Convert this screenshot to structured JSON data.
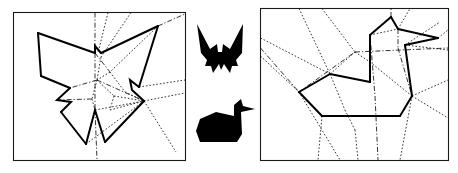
{
  "figure": {
    "width": 458,
    "height": 173,
    "background": "#ffffff",
    "ink_color": "#000000",
    "frame_color": "#1a1a1a",
    "panels": [
      {
        "id": "left-panel",
        "name": "butterfly-crease-pattern",
        "label": "",
        "frame": {
          "x": 13.5,
          "y": 12.5,
          "width": 172,
          "height": 148
        },
        "outline_path": "M 38 33 L 95 53 L 95 46 L 101 53 L 158 26 L 139 87 L 130 80 L 132 90 L 144 101 L 105 142 L 95 110 L 86 144 L 61 112 L 71 102 L 57 100 L 70 88 L 41 76 Z",
        "mountain_paths": [
          "M 38 33 L 95 53",
          "M 95 53 L 95 46 L 101 53",
          "M 101 53 L 158 26",
          "M 158 26 L 139 87",
          "M 139 87 L 130 80 L 132 90 L 144 101",
          "M 144 101 L 105 142",
          "M 105 142 L 95 110 L 86 144",
          "M 86 144 L 61 112",
          "M 61 112 L 71 102 L 57 100 L 70 88",
          "M 70 88 L 41 76",
          "M 41 76 L 38 33"
        ],
        "dotted_creases": [
          "M 108 12.5 L 98 53",
          "M 131 12.5 L 101 57",
          "M 101 57 L 97 80",
          "M 97 80 L 92 99",
          "M 92 99 L 95 110",
          "M 158 26 L 110 72",
          "M 110 72 L 97 80",
          "M 110 72 L 125 92",
          "M 125 92 L 144 101",
          "M 97 80 L 114 96",
          "M 114 96 L 144 101",
          "M 114 96 L 110 110",
          "M 110 110 L 144 101",
          "M 144 101 L 185 93",
          "M 139 87 L 185 80",
          "M 144 101 L 176 152",
          "M 95 110 L 144 101",
          "M 86 144 L 144 101",
          "M 105 142 L 144 101"
        ],
        "dashdot_creases": [
          "M 95 12.5 L 95 53",
          "M 95 53 L 95 110",
          "M 95 110 L 97 160",
          "M 158 26 L 185 14",
          "M 95 53 L 110 72",
          "M 97 80 L 70 88",
          "M 92 99 L 57 100",
          "M 97 80 L 144 101"
        ]
      },
      {
        "id": "right-panel",
        "name": "duck-crease-pattern",
        "label": "",
        "frame": {
          "x": 260.5,
          "y": 8.5,
          "width": 188,
          "height": 152
        },
        "outline_path": "M 391 17 L 370 35 L 370 82 L 330 74 L 299 92 L 322 116 L 400 116 L 412 96 L 405 45 L 438 38 L 398 29 Z",
        "mountain_paths": [
          "M 391 17 L 370 35",
          "M 370 35 L 370 82",
          "M 370 82 L 330 74",
          "M 330 74 L 299 92",
          "M 299 92 L 322 116",
          "M 322 116 L 400 116",
          "M 400 116 L 412 96",
          "M 412 96 L 405 45",
          "M 405 45 L 438 38",
          "M 438 38 L 398 29",
          "M 398 29 L 391 17"
        ],
        "dotted_creases": [
          "M 299 8.5 L 330 74",
          "M 322 8.5 L 355 52",
          "M 355 52 L 370 62",
          "M 355 52 L 330 74",
          "M 260.5 38 L 330 74",
          "M 260.5 56 L 299 92",
          "M 330 74 L 345 110",
          "M 345 110 L 355 130",
          "M 355 130 L 358 160",
          "M 299 92 L 322 116",
          "M 322 116 L 318 160",
          "M 299 92 L 340 160",
          "M 412 96 L 448 80",
          "M 412 96 L 448 118",
          "M 412 96 L 400 160",
          "M 405 45 L 440 22",
          "M 405 45 L 448 50",
          "M 398 29 L 410 8.5",
          "M 438 38 L 448 30",
          "M 370 35 L 398 29",
          "M 370 62 L 412 96"
        ],
        "dashdot_creases": [
          "M 391 17 L 391 8.5",
          "M 260.5 48 L 299 92",
          "M 299 92 L 355 52",
          "M 355 52 L 448 48",
          "M 370 35 L 375 96",
          "M 375 96 L 378 160",
          "M 398 29 L 398 48",
          "M 398 48 L 412 96",
          "M 330 74 L 370 82"
        ]
      }
    ],
    "silhouettes": [
      {
        "id": "butterfly-silhouette",
        "name": "butterfly-model-silhouette",
        "label": "",
        "fill": "#000000",
        "path": "M 197 24 L 210 49 L 217 44 L 218 52 L 222 52 L 223 44 L 230 49 L 243 24 L 242 53 L 236 60 L 238 66 L 232 66 L 230 73 L 224 64 L 221 70 L 219 64 L 213 73 L 211 66 L 205 66 L 207 60 L 201 53 Z"
      },
      {
        "id": "duck-silhouette",
        "name": "duck-model-silhouette",
        "label": "",
        "fill": "#000000",
        "path": "M 241 99 L 234 105 L 234 116 L 216 112 L 200 119 L 196 131 L 200 142 L 237 142 L 242 134 L 241 112 L 255 109 L 243 106 Z"
      }
    ]
  }
}
